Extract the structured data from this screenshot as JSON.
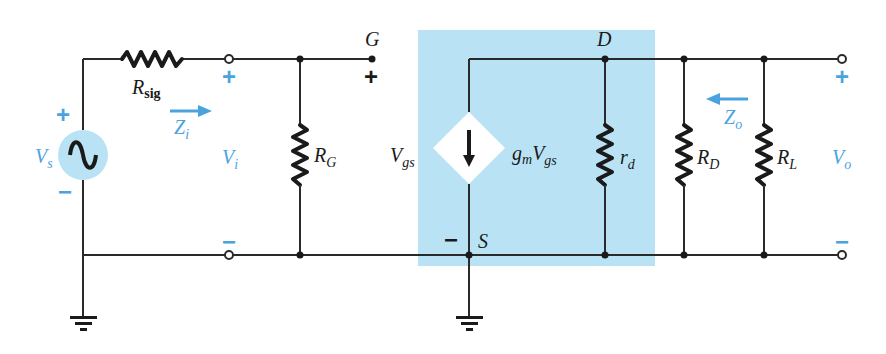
{
  "diagram": {
    "colors": {
      "model_box": "#b9e3f5",
      "accent_blue": "#4aa3df",
      "wire": "#2a2a2a"
    },
    "source": {
      "label": "V",
      "sub": "s",
      "plus": "+",
      "minus": "−"
    },
    "rsig": {
      "label": "R",
      "sub": "sig"
    },
    "input": {
      "plus": "+",
      "minus": "−",
      "vi_label": "V",
      "vi_sub": "i",
      "zi_label": "Z",
      "zi_sub": "i"
    },
    "rg": {
      "label": "R",
      "sub": "G"
    },
    "gate": {
      "label": "G",
      "plus": "+"
    },
    "vgs": {
      "label": "V",
      "sub": "gs"
    },
    "source_node": {
      "label": "S",
      "minus": "−"
    },
    "drain": {
      "label": "D"
    },
    "current_source": {
      "g": "g",
      "g_sub": "m",
      "v": "V",
      "v_sub": "gs"
    },
    "rd": {
      "label": "r",
      "sub": "d"
    },
    "RD": {
      "label": "R",
      "sub": "D"
    },
    "RL": {
      "label": "R",
      "sub": "L"
    },
    "output": {
      "plus": "+",
      "minus": "−",
      "vo_label": "V",
      "vo_sub": "o",
      "zo_label": "Z",
      "zo_sub": "o"
    }
  }
}
